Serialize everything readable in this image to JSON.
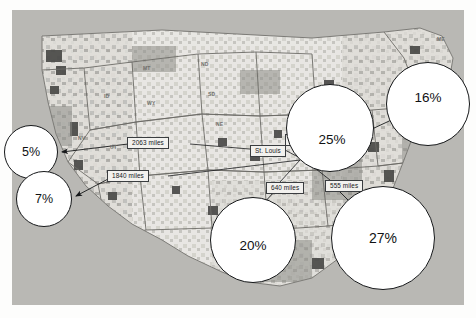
{
  "figure": {
    "kind": "thematic-map-with-callouts",
    "region": "contiguous united states",
    "background_color": "#b9b8b4",
    "bubble_fill": "#ffffff",
    "bubble_stroke": "#16181a",
    "label_fill": "#f2f1ee",
    "label_stroke": "#3a3d40"
  },
  "bubbles": [
    {
      "id": "west-coast-north",
      "value": "5%",
      "cx": 31,
      "cy": 152,
      "r": 27
    },
    {
      "id": "west-coast-south",
      "value": "7%",
      "cx": 44,
      "cy": 199,
      "r": 28
    },
    {
      "id": "midwest",
      "value": "25%",
      "cx": 330,
      "cy": 128,
      "r": 44
    },
    {
      "id": "northeast",
      "value": "16%",
      "cx": 428,
      "cy": 104,
      "r": 42
    },
    {
      "id": "south-central",
      "value": "20%",
      "cx": 253,
      "cy": 240,
      "r": 43
    },
    {
      "id": "southeast",
      "value": "27%",
      "cx": 383,
      "cy": 238,
      "r": 52
    }
  ],
  "distance_labels": [
    {
      "id": "dist-2063",
      "text": "2063 miles",
      "x": 127,
      "y": 137
    },
    {
      "id": "dist-1840",
      "text": "1840 miles",
      "x": 107,
      "y": 170
    },
    {
      "id": "dist-300",
      "text": "300 miles",
      "x": 285,
      "y": 134
    },
    {
      "id": "dist-960",
      "text": "960 miles",
      "x": 326,
      "y": 143
    },
    {
      "id": "dist-640",
      "text": "640 miles",
      "x": 266,
      "y": 182
    },
    {
      "id": "dist-555",
      "text": "555 miles",
      "x": 325,
      "y": 180
    }
  ],
  "city_labels": [
    {
      "id": "city-st-louis",
      "text": "St. Louis",
      "x": 250,
      "y": 145
    }
  ],
  "state_labels": [
    {
      "text": "MT",
      "x": 143,
      "y": 66
    },
    {
      "text": "ND",
      "x": 201,
      "y": 62
    },
    {
      "text": "SD",
      "x": 208,
      "y": 92
    },
    {
      "text": "NE",
      "x": 216,
      "y": 122
    },
    {
      "text": "WY",
      "x": 147,
      "y": 101
    },
    {
      "text": "ID",
      "x": 104,
      "y": 94
    },
    {
      "text": "NV",
      "x": 78,
      "y": 136
    },
    {
      "text": "UT",
      "x": 110,
      "y": 145
    },
    {
      "text": "ME",
      "x": 437,
      "y": 37
    }
  ],
  "leaders": [
    {
      "id": "leader-2063-to-5",
      "from": "dist-2063",
      "to": "west-coast-north"
    },
    {
      "id": "leader-1840-to-7",
      "from": "dist-1840",
      "to": "west-coast-south"
    },
    {
      "id": "leader-300-to-25",
      "from": "dist-300",
      "to": "midwest"
    },
    {
      "id": "leader-960-to-16",
      "from": "dist-960",
      "to": "northeast"
    },
    {
      "id": "leader-640-to-20",
      "from": "dist-640",
      "to": "south-central"
    },
    {
      "id": "leader-555-to-27",
      "from": "dist-555",
      "to": "southeast"
    }
  ]
}
